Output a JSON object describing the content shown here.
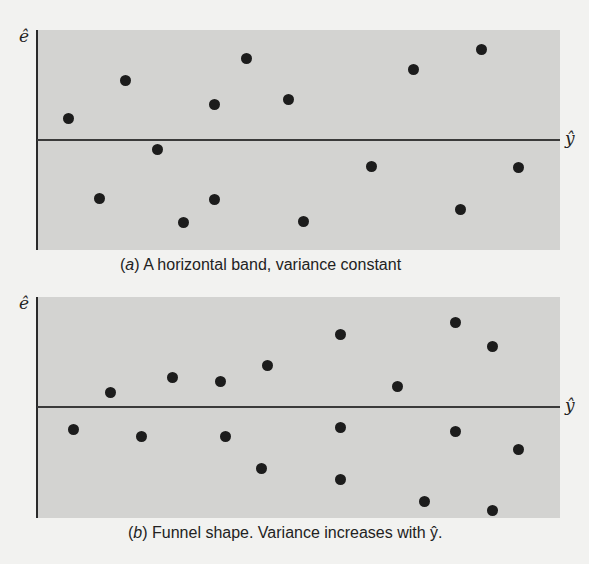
{
  "chart_data": [
    {
      "type": "scatter",
      "title": "",
      "caption_letter": "a",
      "caption_text": " A horizontal band, variance constant",
      "xlabel": "ŷ",
      "ylabel": "ê",
      "grid": false,
      "reference_line": 0,
      "xlim": [
        0,
        100
      ],
      "ylim": [
        -1,
        1
      ],
      "points": [
        {
          "x": 6,
          "y": 0.2
        },
        {
          "x": 17,
          "y": 0.54
        },
        {
          "x": 23,
          "y": -0.09
        },
        {
          "x": 12,
          "y": -0.53
        },
        {
          "x": 28,
          "y": -0.75
        },
        {
          "x": 34,
          "y": 0.32
        },
        {
          "x": 34,
          "y": -0.54
        },
        {
          "x": 40,
          "y": 0.74
        },
        {
          "x": 48,
          "y": 0.37
        },
        {
          "x": 51,
          "y": -0.74
        },
        {
          "x": 64,
          "y": -0.24
        },
        {
          "x": 72,
          "y": 0.64
        },
        {
          "x": 81,
          "y": -0.63
        },
        {
          "x": 85,
          "y": 0.82
        },
        {
          "x": 92,
          "y": -0.25
        }
      ]
    },
    {
      "type": "scatter",
      "title": "",
      "caption_letter": "b",
      "caption_text": " Funnel shape. Variance increases with ŷ.",
      "xlabel": "ŷ",
      "ylabel": "ê",
      "grid": false,
      "reference_line": 0,
      "xlim": [
        0,
        100
      ],
      "ylim": [
        -1,
        1
      ],
      "points": [
        {
          "x": 7,
          "y": -0.2
        },
        {
          "x": 14,
          "y": 0.13
        },
        {
          "x": 20,
          "y": -0.27
        },
        {
          "x": 26,
          "y": 0.27
        },
        {
          "x": 35,
          "y": 0.23
        },
        {
          "x": 36,
          "y": -0.27
        },
        {
          "x": 44,
          "y": 0.38
        },
        {
          "x": 43,
          "y": -0.56
        },
        {
          "x": 58,
          "y": 0.66
        },
        {
          "x": 58,
          "y": -0.19
        },
        {
          "x": 58,
          "y": -0.66
        },
        {
          "x": 69,
          "y": 0.19
        },
        {
          "x": 74,
          "y": -0.86
        },
        {
          "x": 80,
          "y": 0.77
        },
        {
          "x": 80,
          "y": -0.22
        },
        {
          "x": 87,
          "y": 0.55
        },
        {
          "x": 92,
          "y": -0.39
        },
        {
          "x": 87,
          "y": -0.94
        }
      ]
    }
  ]
}
